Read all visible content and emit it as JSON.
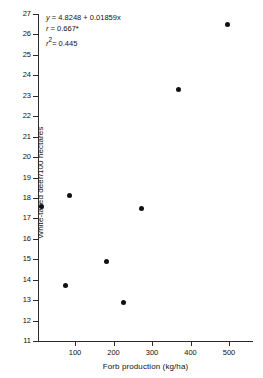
{
  "chart_data": {
    "type": "scatter",
    "title": "",
    "xlabel": "Forb production (kg/ha)",
    "ylabel": "White-tailed deer/100 hectares",
    "xlim": [
      0,
      560
    ],
    "ylim": [
      11,
      27
    ],
    "grid": false,
    "legend": "none",
    "xticks": [
      100,
      200,
      300,
      400,
      500
    ],
    "yticks": [
      11,
      12,
      13,
      14,
      15,
      16,
      17,
      18,
      19,
      20,
      21,
      22,
      23,
      24,
      25,
      26,
      27
    ],
    "x": [
      12,
      76,
      87,
      183,
      225,
      274,
      370,
      497
    ],
    "y": [
      17.6,
      13.7,
      18.1,
      14.9,
      12.9,
      17.5,
      23.3,
      26.5
    ],
    "points": [
      {
        "x": 12,
        "y": 17.6
      },
      {
        "x": 76,
        "y": 13.7
      },
      {
        "x": 87,
        "y": 18.1
      },
      {
        "x": 183,
        "y": 14.9
      },
      {
        "x": 225,
        "y": 12.9
      },
      {
        "x": 274,
        "y": 17.5
      },
      {
        "x": 370,
        "y": 23.3
      },
      {
        "x": 497,
        "y": 26.5
      }
    ],
    "marker": {
      "shape": "circle",
      "color": "#111111",
      "size": 5
    },
    "annotations": {
      "equation": "y = 4.8248 + 0.01859x",
      "equation_var": "y",
      "equation_rest": " = 4.8248 + 0.01859x",
      "correlation_var": "r",
      "correlation_rest": " = 0.667*",
      "r_squared_var": "r",
      "r_squared_sup": "2",
      "r_squared_rest": "= 0.445"
    }
  },
  "axes": {
    "y_title": "White-tailed deer/100 hectares",
    "x_title": "Forb production (kg/ha)",
    "y_tick_labels": [
      "27",
      "26",
      "25",
      "24",
      "23",
      "22",
      "21",
      "20",
      "19",
      "18",
      "17",
      "16",
      "15",
      "14",
      "13",
      "12",
      "11"
    ],
    "x_tick_labels": [
      "100",
      "200",
      "300",
      "400",
      "500"
    ]
  },
  "colors": {
    "axis": "#2b2b2b",
    "marker": "#111111",
    "text": "#111111",
    "background": "#ffffff"
  }
}
